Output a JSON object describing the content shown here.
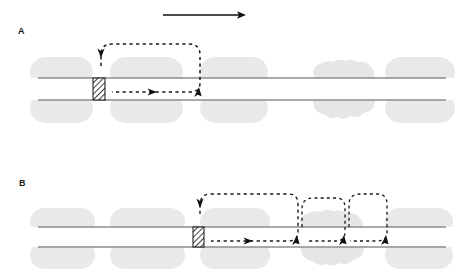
{
  "figure": {
    "width": 476,
    "height": 277,
    "background": "#ffffff",
    "type": "scientific-schematic-diagram"
  },
  "colors": {
    "blob_fill": "#e9e9e9",
    "blob_fill_irregular": "#e4e4e4",
    "channel_line": "#9a9a9a",
    "channel_line_dark": "#7d7d7d",
    "dashed_stroke": "#1a1a1a",
    "arrow_stroke": "#111111",
    "hatch_stroke": "#111111",
    "hatch_background": "#ffffff",
    "label_text": "#1a1a1a"
  },
  "panels": [
    {
      "id": "A",
      "label": "A",
      "label_x": 18,
      "label_y": 34,
      "channel": {
        "top_line_y": 78,
        "bottom_line_y": 100,
        "x_start": 38,
        "x_end": 446
      },
      "blockage": {
        "name": "hatched-block",
        "x": 93,
        "y": 78,
        "width": 12,
        "height": 22,
        "hatch_angle_deg": 45
      },
      "blobs_top": [
        {
          "x": 38,
          "y": 57,
          "width": 55,
          "height": 21,
          "shape": "rounded-rect",
          "radius": 16
        },
        {
          "x": 110,
          "y": 57,
          "width": 73,
          "height": 21,
          "shape": "rounded-rect",
          "radius": 16
        },
        {
          "x": 200,
          "y": 57,
          "width": 68,
          "height": 21,
          "shape": "rounded-rect",
          "radius": 16
        },
        {
          "x": 313,
          "y": 62,
          "width": 62,
          "height": 16,
          "shape": "irregular"
        },
        {
          "x": 385,
          "y": 57,
          "width": 60,
          "height": 21,
          "shape": "rounded-rect",
          "radius": 16
        }
      ],
      "blobs_bottom": [
        {
          "x": 38,
          "y": 100,
          "width": 55,
          "height": 23,
          "shape": "rounded-rect",
          "radius": 16
        },
        {
          "x": 110,
          "y": 100,
          "width": 73,
          "height": 23,
          "shape": "rounded-rect",
          "radius": 16
        },
        {
          "x": 200,
          "y": 100,
          "width": 68,
          "height": 23,
          "shape": "rounded-rect",
          "radius": 16
        },
        {
          "x": 313,
          "y": 100,
          "width": 62,
          "height": 20,
          "shape": "irregular"
        },
        {
          "x": 385,
          "y": 100,
          "width": 60,
          "height": 23,
          "shape": "rounded-rect",
          "radius": 16
        }
      ],
      "loops": [
        {
          "name": "recirculation-loop",
          "left_x": 101,
          "right_x": 200,
          "top_y": 44,
          "bottom_y": 92,
          "corner_radius": 11,
          "down_arrow_at": {
            "x": 101,
            "y": 55,
            "direction": "down"
          },
          "up_arrow_at": {
            "x": 200,
            "y": 90,
            "direction": "up-left"
          },
          "right_arrow_at": {
            "x": 150,
            "y": 92,
            "direction": "right"
          }
        }
      ]
    },
    {
      "id": "B",
      "label": "B",
      "label_x": 19,
      "label_y": 186,
      "channel": {
        "top_line_y": 227,
        "bottom_line_y": 247,
        "x_start": 38,
        "x_end": 446
      },
      "blockage": {
        "name": "hatched-block",
        "x": 193,
        "y": 227,
        "width": 11,
        "height": 20,
        "hatch_angle_deg": 45
      },
      "blobs_top": [
        {
          "x": 38,
          "y": 208,
          "width": 57,
          "height": 19,
          "shape": "rounded-rect",
          "radius": 15
        },
        {
          "x": 110,
          "y": 208,
          "width": 75,
          "height": 19,
          "shape": "rounded-rect",
          "radius": 15
        },
        {
          "x": 200,
          "y": 208,
          "width": 70,
          "height": 19,
          "shape": "rounded-rect",
          "radius": 15
        },
        {
          "x": 300,
          "y": 212,
          "width": 65,
          "height": 15,
          "shape": "irregular"
        },
        {
          "x": 385,
          "y": 208,
          "width": 58,
          "height": 19,
          "shape": "rounded-rect",
          "radius": 15
        }
      ],
      "blobs_bottom": [
        {
          "x": 38,
          "y": 247,
          "width": 57,
          "height": 22,
          "shape": "rounded-rect",
          "radius": 15
        },
        {
          "x": 110,
          "y": 247,
          "width": 75,
          "height": 22,
          "shape": "rounded-rect",
          "radius": 15
        },
        {
          "x": 200,
          "y": 247,
          "width": 70,
          "height": 22,
          "shape": "rounded-rect",
          "radius": 15
        },
        {
          "x": 300,
          "y": 247,
          "width": 65,
          "height": 20,
          "shape": "irregular"
        },
        {
          "x": 385,
          "y": 247,
          "width": 58,
          "height": 22,
          "shape": "rounded-rect",
          "radius": 15
        }
      ],
      "loops": [
        {
          "name": "recirculation-loop-outer",
          "left_x": 200,
          "right_x": 298,
          "top_y": 194,
          "bottom_y": 241,
          "corner_radius": 11,
          "down_arrow_at": {
            "x": 200,
            "y": 205,
            "direction": "down"
          },
          "up_arrow_at": {
            "x": 298,
            "y": 239,
            "direction": "up-left"
          },
          "right_arrow_at": {
            "x": 246,
            "y": 241,
            "direction": "right"
          }
        },
        {
          "name": "recirculation-loop-middle",
          "left_x": 298,
          "right_x": 345,
          "top_y": 198,
          "bottom_y": 241,
          "corner_radius": 11,
          "up_arrow_at": {
            "x": 345,
            "y": 239,
            "direction": "up-left"
          }
        },
        {
          "name": "recirculation-loop-inner",
          "left_x": 345,
          "right_x": 387,
          "top_y": 194,
          "bottom_y": 241,
          "corner_radius": 11,
          "up_arrow_at": {
            "x": 387,
            "y": 239,
            "direction": "up-left"
          }
        }
      ]
    }
  ],
  "direction_arrow": {
    "name": "flow-direction-arrow",
    "x_start": 163,
    "x_end": 245,
    "y": 15,
    "head_length": 8,
    "head_width": 6
  }
}
